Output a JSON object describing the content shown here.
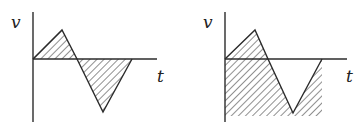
{
  "figure": {
    "colors": {
      "line": "#2b2b2b",
      "hatch": "#333333",
      "background": "#ffffff"
    },
    "graphs": [
      {
        "id": "left",
        "y_axis_label": "v",
        "x_axis_label": "t",
        "shading": "area between curve and t-axis",
        "curve_points": [
          [
            33,
            59
          ],
          [
            62,
            30
          ],
          [
            77,
            59
          ],
          [
            103,
            112
          ],
          [
            132,
            59
          ]
        ]
      },
      {
        "id": "right",
        "y_axis_label": "v",
        "x_axis_label": "t",
        "shading": "area between curve and a baseline below the t-axis",
        "curve_points": [
          [
            225,
            59
          ],
          [
            255,
            30
          ],
          [
            268,
            59
          ],
          [
            293,
            113
          ],
          [
            322,
            59
          ]
        ]
      }
    ]
  }
}
